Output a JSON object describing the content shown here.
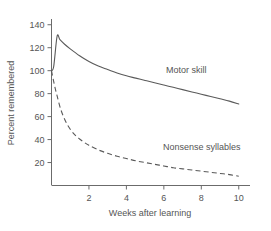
{
  "chart_data": {
    "type": "line",
    "title": "",
    "xlabel": "Weeks after learning",
    "ylabel": "Percent remembered",
    "xlim": [
      0,
      10.6
    ],
    "ylim": [
      0,
      145
    ],
    "grid": false,
    "legend_position": "inline-annotation",
    "xticks": [
      2,
      4,
      6,
      8,
      10
    ],
    "xtick_labels": [
      "2",
      "4",
      "6",
      "8",
      "10"
    ],
    "yticks": [
      20,
      40,
      60,
      80,
      100,
      120,
      140
    ],
    "ytick_labels": [
      "20",
      "40",
      "60",
      "80",
      "100",
      "120",
      "140"
    ],
    "series": [
      {
        "name": "Motor skill",
        "style": "solid",
        "color": "#5a5a5a",
        "annotation": "Motor skill",
        "x": [
          0.0,
          0.12,
          0.3,
          0.45,
          0.7,
          1.0,
          1.5,
          2.0,
          2.5,
          3.0,
          3.5,
          4.0,
          4.5,
          5.0,
          5.5,
          6.0,
          6.5,
          7.0,
          7.5,
          8.0,
          8.5,
          9.0,
          9.5,
          10.0
        ],
        "y": [
          100,
          104,
          130,
          127,
          123,
          119,
          113,
          108,
          104,
          101,
          98,
          95.5,
          93.5,
          91.5,
          89.5,
          87.5,
          85.5,
          83.5,
          81.5,
          79.5,
          77.5,
          75.5,
          73.5,
          71
        ]
      },
      {
        "name": "Nonsense syllables",
        "style": "dashed",
        "color": "#5a5a5a",
        "annotation": "Nonsense syllables",
        "x": [
          0.0,
          0.15,
          0.3,
          0.5,
          0.75,
          1.0,
          1.25,
          1.5,
          1.75,
          2.0,
          2.5,
          3.0,
          3.5,
          4.0,
          4.5,
          5.0,
          5.5,
          6.0,
          6.5,
          7.0,
          7.5,
          8.0,
          8.5,
          9.0,
          9.5,
          10.0
        ],
        "y": [
          100,
          88,
          78,
          66,
          56,
          49,
          44,
          40.5,
          37.5,
          35,
          31,
          28,
          25.5,
          23.5,
          21.5,
          20,
          18.5,
          17,
          15.5,
          14.5,
          13.5,
          12.5,
          11.5,
          10.5,
          9.5,
          8
        ]
      }
    ],
    "annotations": [
      {
        "text": "Motor skill",
        "x_px": 166,
        "y_px": 73
      },
      {
        "text": "Nonsense syllables",
        "x_px": 163,
        "y_px": 150
      }
    ]
  }
}
